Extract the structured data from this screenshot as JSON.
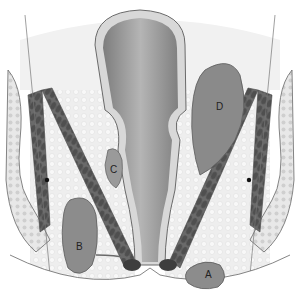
{
  "figure": {
    "type": "anatomical-illustration",
    "labels": [
      {
        "id": "A",
        "text": "A",
        "x": 205,
        "y": 275
      },
      {
        "id": "B",
        "text": "B",
        "x": 80,
        "y": 250
      },
      {
        "id": "C",
        "text": "C",
        "x": 113,
        "y": 172
      },
      {
        "id": "D",
        "text": "D",
        "x": 220,
        "y": 108
      }
    ]
  },
  "colors": {
    "background": "#ffffff",
    "tissue_light": "#e4e4e4",
    "tissue_mid": "#9a9a9a",
    "tissue_dark": "#6e6e6e",
    "muscle": "#5a5a5a",
    "outline": "#555555"
  }
}
